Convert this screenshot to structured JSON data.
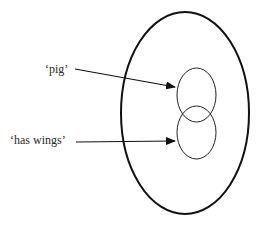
{
  "diagram": {
    "labels": {
      "pig": "‘pig’",
      "has_wings": "‘has wings’"
    },
    "shapes": {
      "outer_ellipse": {
        "cx": 185,
        "cy": 113,
        "rx": 64,
        "ry": 101
      },
      "pig_circle": {
        "cx": 196.5,
        "cy": 95,
        "rx": 19.5,
        "ry": 27
      },
      "has_wings_circle": {
        "cx": 196.5,
        "cy": 132.5,
        "rx": 19.5,
        "ry": 26.5
      }
    },
    "arrows": [
      {
        "from": "pig-label",
        "to": "pig-circle"
      },
      {
        "from": "has-wings-label",
        "to": "has-wings-circle"
      }
    ],
    "colors": {
      "stroke": "#111111",
      "text": "#2a2a2a",
      "background": "#ffffff"
    }
  }
}
